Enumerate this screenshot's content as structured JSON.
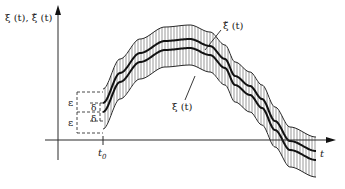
{
  "diagram": {
    "y_axis_label": "ξ (t), ξ̃ (t)",
    "x_axis_label": "t",
    "t0_label": "t",
    "t0_subscript": "0",
    "curve_labels": {
      "perturbed": "ξ̃ (t)",
      "nominal": "ξ (t)"
    },
    "tolerance_labels": {
      "epsilon_upper": "ε",
      "epsilon_lower": "ε",
      "delta_upper": "δ",
      "delta_lower": "δ"
    }
  }
}
